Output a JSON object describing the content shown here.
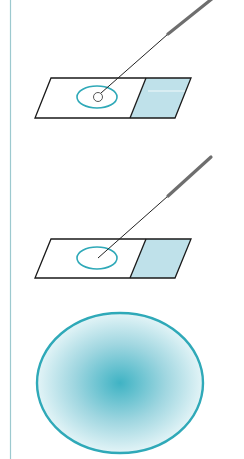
{
  "figure": {
    "colors": {
      "accent": "#2fa9b8",
      "label_fill": "#bfe1ea",
      "outline": "#1a1a1a",
      "margin_line": "#9cc9cf",
      "handle": "#6e6e6e"
    },
    "panels": [
      {
        "step": 1,
        "label": "Drop placed on slide with loop"
      },
      {
        "step": 2,
        "label": "Drop spread into thin film"
      },
      {
        "step": 3,
        "label": "Magnified smear"
      }
    ]
  }
}
